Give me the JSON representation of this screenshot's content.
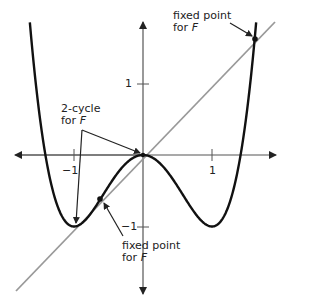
{
  "diagram": {
    "function": "F(x) = x^4 - 2x^2",
    "axes": {
      "x_ticks": [
        {
          "value": -1,
          "label": "−1"
        },
        {
          "value": 1,
          "label": "1"
        }
      ],
      "y_ticks": [
        {
          "value": 1,
          "label": "1"
        },
        {
          "value": -1,
          "label": "−1"
        }
      ]
    },
    "lines": [
      {
        "name": "graph of F",
        "color": "#111111"
      },
      {
        "name": "diagonal y = x",
        "color": "#999999"
      }
    ],
    "annotations": {
      "fixed_point_top": {
        "line1": "fixed point",
        "line2_prefix": "for ",
        "line2_var": "F"
      },
      "two_cycle": {
        "line1": "2-cycle",
        "line2_prefix": "for ",
        "line2_var": "F"
      },
      "fixed_point_bottom": {
        "line1": "fixed point",
        "line2_prefix": "for ",
        "line2_var": "F"
      }
    },
    "points": [
      {
        "label": "fixed point (top right)",
        "x": 1.618,
        "y": 1.618
      },
      {
        "label": "fixed point (lower left)",
        "x": -0.618,
        "y": -0.618
      },
      {
        "label": "2-cycle point",
        "x": 0,
        "y": 0
      },
      {
        "label": "2-cycle point",
        "x": -1,
        "y": -1
      }
    ]
  }
}
